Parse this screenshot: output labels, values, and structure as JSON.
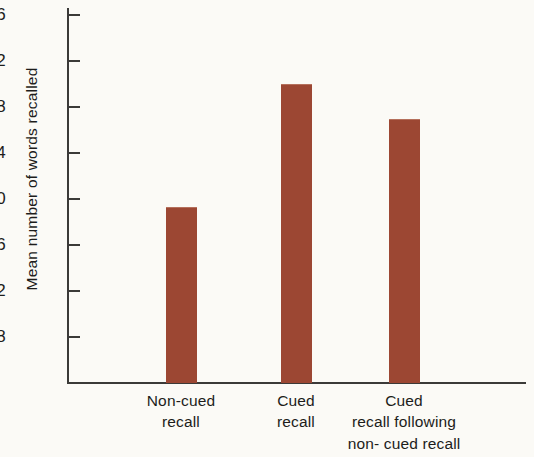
{
  "figure": {
    "background_color": "#fbfaf6",
    "axis_color": "#3b3a38",
    "bar_color": "#9c4733"
  },
  "chart_data": {
    "type": "bar",
    "title": "",
    "xlabel": "",
    "ylabel": "Mean number of words recalled",
    "categories": [
      "Non-cued\nrecall",
      "Cued\nrecall",
      "Cued\nrecall following\nnon- cued recall"
    ],
    "values": [
      19.3,
      30.0,
      27.0
    ],
    "ylim": [
      6,
      37.5
    ],
    "yticks": [
      8,
      12,
      16,
      20,
      24,
      28,
      32,
      36
    ],
    "ytick_labels": [
      "8",
      "12",
      "16",
      "20",
      "24",
      "28",
      "32",
      "36"
    ],
    "grid": false,
    "legend": null,
    "series": [
      {
        "name": "Mean number of words recalled",
        "values": [
          19.3,
          30.0,
          27.0
        ],
        "color": "#9c4733"
      }
    ]
  }
}
